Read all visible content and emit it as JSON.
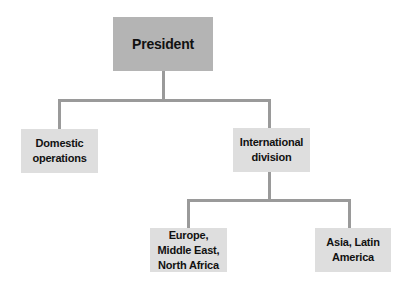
{
  "chart": {
    "nodes": {
      "president": "President",
      "domestic": "Domestic operations",
      "international": "International division",
      "europe": "Europe, Middle East, North Africa",
      "asia": "Asia, Latin America"
    },
    "edges": [
      [
        "President",
        "Domestic operations"
      ],
      [
        "President",
        "International division"
      ],
      [
        "International division",
        "Europe, Middle East, North Africa"
      ],
      [
        "International division",
        "Asia, Latin America"
      ]
    ],
    "colors": {
      "top_box": "#b4b4b4",
      "sub_box": "#dedede",
      "connector": "#9a9a9a"
    }
  }
}
